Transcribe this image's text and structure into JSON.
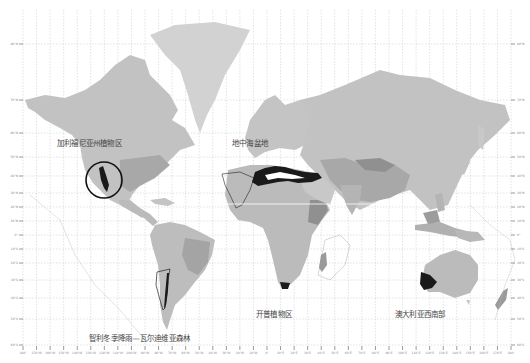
{
  "map": {
    "type": "world-map",
    "projection": "mercator",
    "regions": [
      {
        "id": "california",
        "label": "加利福尼亚州植物区",
        "x": 57,
        "y": 137
      },
      {
        "id": "mediterranean",
        "label": "地中海盆地",
        "x": 232,
        "y": 137
      },
      {
        "id": "chile",
        "label": "智利冬季降雨—瓦尔迪维亚森林",
        "x": 89,
        "y": 332
      },
      {
        "id": "cape",
        "label": "开普植物区",
        "x": 256,
        "y": 310
      },
      {
        "id": "sw-australia",
        "label": "澳大利亚西南部",
        "x": 395,
        "y": 310
      }
    ],
    "colors": {
      "land_light": "#c9c9c9",
      "land_mid": "#b4b4b4",
      "land_dark": "#9a9a9a",
      "hotspot": "#1a1a1a",
      "grid": "#b0b0b0",
      "ocean": "#ffffff"
    },
    "lat_ticks": [
      "80°N",
      "70°N",
      "60°N",
      "50°N",
      "40°N",
      "30°N",
      "20°N",
      "10°N",
      "0°",
      "10°S",
      "20°S",
      "30°S",
      "40°S",
      "50°S",
      "60°S"
    ],
    "lon_ticks": [
      "180°",
      "170°W",
      "160°W",
      "150°W",
      "140°W",
      "130°W",
      "120°W",
      "110°W",
      "100°W",
      "90°W",
      "80°W",
      "70°W",
      "60°W",
      "50°W",
      "40°W",
      "30°W",
      "20°W",
      "10°W",
      "0°",
      "10°E",
      "20°E",
      "30°E",
      "40°E",
      "50°E",
      "60°E",
      "70°E",
      "80°E",
      "90°E",
      "100°E",
      "110°E",
      "120°E",
      "130°E",
      "140°E",
      "150°E",
      "160°E",
      "170°E",
      "180°"
    ]
  }
}
